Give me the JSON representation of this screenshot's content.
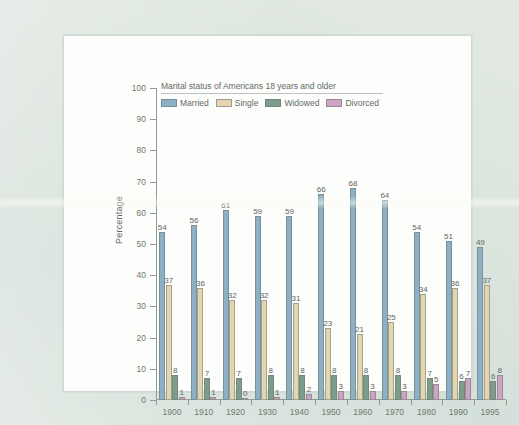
{
  "chart_data": {
    "type": "bar",
    "title": "Marital status of Americans 18 years and older",
    "xlabel": "",
    "ylabel": "Percentage",
    "ylim": [
      0,
      100
    ],
    "ytick_step": 10,
    "yticks": [
      0,
      10,
      20,
      30,
      40,
      50,
      60,
      70,
      80,
      90,
      100
    ],
    "grid": false,
    "legend_position": "top-left inside plot",
    "value_labels": true,
    "categories": [
      "1900",
      "1910",
      "1920",
      "1930",
      "1940",
      "1950",
      "1960",
      "1970",
      "1980",
      "1990",
      "1995"
    ],
    "series": [
      {
        "name": "Married",
        "color": "#8cb0c6",
        "values": [
          54,
          56,
          61,
          59,
          59,
          66,
          68,
          64,
          54,
          51,
          49
        ]
      },
      {
        "name": "Single",
        "color": "#e3d5b0",
        "values": [
          37,
          36,
          32,
          32,
          31,
          23,
          21,
          25,
          34,
          36,
          37
        ]
      },
      {
        "name": "Widowed",
        "color": "#7d9c8c",
        "values": [
          8,
          7,
          7,
          8,
          8,
          8,
          8,
          8,
          7,
          6,
          6
        ]
      },
      {
        "name": "Divorced",
        "color": "#cfa3c2",
        "values": [
          1,
          1,
          0,
          1,
          2,
          3,
          3,
          3,
          5,
          7,
          8
        ]
      }
    ]
  },
  "page": {
    "background_color": "#dde6e0",
    "panel_color": "#fdfdfb"
  }
}
